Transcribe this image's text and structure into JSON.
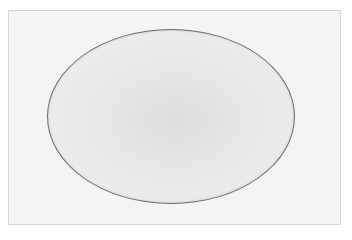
{
  "image": {
    "description": "Pencil-drawn gray oval on a light gray paper background with a thin border",
    "shape": "oval",
    "colors": {
      "background": "#ffffff",
      "paper": "#f4f4f4",
      "oval_fill": "#e6e6e6",
      "oval_outline": "#6a6a6a"
    }
  }
}
